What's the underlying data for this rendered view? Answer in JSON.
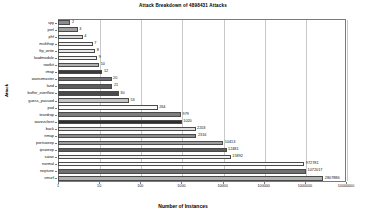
{
  "chart_data": {
    "type": "bar",
    "orientation": "horizontal",
    "title": "Attack Breakdown of 4898431 Attacks",
    "xlabel": "Number of Instances",
    "ylabel": "Attack",
    "xscale": "log",
    "xlim": [
      1,
      10000000
    ],
    "grid": true,
    "legend": "none",
    "xticks": [
      "1",
      "10",
      "100",
      "1000",
      "10000",
      "100000",
      "1000000",
      "10000000"
    ],
    "xtick_values": [
      1,
      10,
      100,
      1000,
      10000,
      100000,
      1000000,
      10000000
    ],
    "categories": [
      "spy",
      "perl",
      "phf",
      "multihop",
      "ftp_write",
      "loadmodule",
      "rootkit",
      "imap",
      "warezmaster",
      "land",
      "buffer_overflow",
      "guess_passwd",
      "pod",
      "teardrop",
      "warezclient",
      "back",
      "nmap",
      "portsweep",
      "ipsweep",
      "satan",
      "normal",
      "neptune",
      "smurf"
    ],
    "values": [
      2,
      3,
      4,
      7,
      8,
      9,
      10,
      12,
      20,
      21,
      30,
      53,
      264,
      979,
      1020,
      2203,
      2316,
      10413,
      12481,
      15892,
      972781,
      1072017,
      2807886
    ],
    "value_labels": [
      "2",
      "3",
      "4",
      "7",
      "8",
      "9",
      "10",
      "12",
      "20",
      "21",
      "30",
      "53",
      "264",
      "979",
      "1020",
      "2203",
      "2316",
      "10413",
      "12481",
      "15892",
      "972781",
      "1072017",
      "2807886"
    ],
    "bar_fills": [
      "#8c8c8c",
      "#9e9e9e",
      "#d6d6d6",
      "#f2f2f2",
      "#e8e8e8",
      "#f2f2f2",
      "#b0b0b0",
      "#3a3a3a",
      "#6e6e6e",
      "#5c5c5c",
      "#4a4a4a",
      "#c4c4c4",
      "#fafafa",
      "#7d7d7d",
      "#2e2e2e",
      "#e0e0e0",
      "#8c8c8c",
      "#9e9e9e",
      "#5c5c5c",
      "#f2f2f2",
      "#fafafa",
      "#707070",
      "#b0b0b0"
    ],
    "colors": {
      "frame": "#7a7a7a",
      "grid": "#c8c8c8",
      "text": "#111111",
      "background": "#ffffff"
    }
  }
}
